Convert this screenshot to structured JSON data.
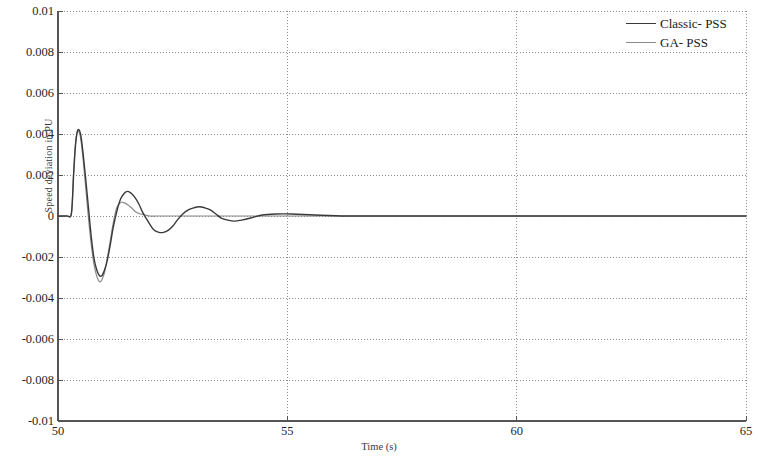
{
  "chart_data": {
    "type": "line",
    "title": "",
    "xlabel": "Time (s)",
    "ylabel": "Speed deviation in PU",
    "xlim": [
      50,
      65
    ],
    "ylim": [
      -0.01,
      0.01
    ],
    "xticks": [
      "50",
      "55",
      "60",
      "65"
    ],
    "xtick_values": [
      50,
      55,
      60,
      65
    ],
    "yticks": [
      "0.01",
      "0.008",
      "0.006",
      "0.004",
      "0.002",
      "0",
      "-0.002",
      "-0.004",
      "-0.006",
      "-0.008",
      "-0.01"
    ],
    "ytick_values": [
      0.01,
      0.008,
      0.006,
      0.004,
      0.002,
      0,
      -0.002,
      -0.004,
      -0.006,
      -0.008,
      -0.01
    ],
    "grid": true,
    "grid_style": "dotted",
    "grid_color": "#8c8c8c",
    "legend_position": "top-right",
    "axis_color": "#555555",
    "background": "#ffffff",
    "series": [
      {
        "name": "Classic- PSS",
        "color": "#3a3a3a",
        "width": 1.4,
        "x": [
          50.0,
          50.1,
          50.2,
          50.28,
          50.31,
          50.34,
          50.38,
          50.42,
          50.46,
          50.5,
          50.55,
          50.6,
          50.66,
          50.72,
          50.78,
          50.84,
          50.9,
          50.96,
          51.02,
          51.08,
          51.14,
          51.2,
          51.28,
          51.36,
          51.44,
          51.52,
          51.6,
          51.68,
          51.76,
          51.84,
          51.92,
          52.0,
          52.1,
          52.2,
          52.3,
          52.4,
          52.5,
          52.6,
          52.72,
          52.84,
          52.96,
          53.08,
          53.2,
          53.32,
          53.44,
          53.56,
          53.7,
          53.85,
          54.0,
          54.2,
          54.45,
          54.75,
          55.1,
          55.6,
          56.3,
          57.2,
          58.5,
          60.0,
          62.0,
          65.0
        ],
        "y": [
          0.0,
          0.0,
          0.0,
          0.0,
          0.0006,
          0.002,
          0.0034,
          0.0041,
          0.0042,
          0.0039,
          0.003,
          0.0019,
          0.0005,
          -0.0009,
          -0.002,
          -0.0026,
          -0.0029,
          -0.0029,
          -0.0026,
          -0.0021,
          -0.0014,
          -0.0006,
          0.0002,
          0.0008,
          0.0011,
          0.0012,
          0.0011,
          0.0009,
          0.0006,
          0.0002,
          -0.0001,
          -0.0004,
          -0.0007,
          -0.0008,
          -0.0008,
          -0.0007,
          -0.0005,
          -0.0002,
          0.0001,
          0.0003,
          0.0004,
          0.00045,
          0.0004,
          0.0003,
          0.0001,
          -0.0001,
          -0.0002,
          -0.00025,
          -0.0002,
          -0.0001,
          5e-05,
          0.0001,
          0.0001,
          5e-05,
          0.0,
          0.0,
          0.0,
          0.0,
          0.0,
          0.0
        ]
      },
      {
        "name": "GA- PSS",
        "color": "#8a8a8a",
        "width": 1.2,
        "x": [
          50.0,
          50.1,
          50.2,
          50.28,
          50.31,
          50.34,
          50.38,
          50.42,
          50.46,
          50.5,
          50.55,
          50.6,
          50.66,
          50.72,
          50.78,
          50.84,
          50.9,
          50.96,
          51.02,
          51.08,
          51.14,
          51.2,
          51.28,
          51.36,
          51.44,
          51.52,
          51.6,
          51.7,
          51.8,
          51.9,
          52.0,
          52.15,
          52.3,
          52.5,
          52.75,
          53.0,
          53.4,
          53.9,
          54.5,
          55.2,
          56.2,
          57.5,
          59.0,
          61.0,
          63.0,
          65.0
        ],
        "y": [
          0.0,
          0.0,
          0.0,
          0.0,
          0.0006,
          0.0021,
          0.0035,
          0.0041,
          0.0041,
          0.0037,
          0.0027,
          0.0015,
          0.0,
          -0.0013,
          -0.0023,
          -0.0029,
          -0.0032,
          -0.0031,
          -0.0027,
          -0.002,
          -0.0012,
          -0.0004,
          0.0004,
          0.00065,
          0.00065,
          0.00055,
          0.0004,
          0.0002,
          0.0001,
          5e-05,
          0.0,
          0.0,
          0.0,
          0.0,
          0.0,
          0.0,
          0.0,
          0.0,
          0.0,
          0.0,
          0.0,
          0.0,
          0.0,
          0.0,
          0.0,
          0.0
        ]
      }
    ]
  },
  "plot_area": {
    "left": 58,
    "top": 11,
    "right": 746,
    "bottom": 421
  }
}
